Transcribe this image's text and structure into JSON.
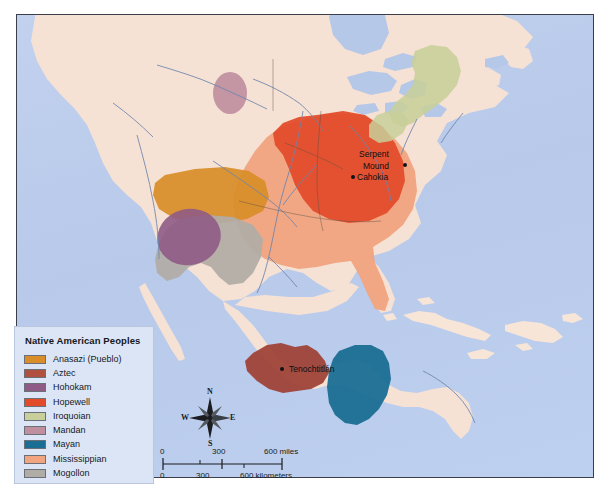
{
  "map": {
    "title_alt": "Native American Peoples map of North America",
    "ocean_color": "#bccdec",
    "land_color": "#f6e2d4",
    "border_color": "#3a3f4a"
  },
  "legend": {
    "title": "Native American Peoples",
    "items": [
      {
        "label": "Anasazi (Pueblo)",
        "color": "#d98e2a",
        "key": "anasazi"
      },
      {
        "label": "Aztec",
        "color": "#b0503f",
        "key": "aztec"
      },
      {
        "label": "Hohokam",
        "color": "#8f5b86",
        "key": "hohokam"
      },
      {
        "label": "Hopewell",
        "color": "#e24a2a",
        "key": "hopewell"
      },
      {
        "label": "Iroquoian",
        "color": "#c8cf9a",
        "key": "iroquoian"
      },
      {
        "label": "Mandan",
        "color": "#bf8fa0",
        "key": "mandan"
      },
      {
        "label": "Mayan",
        "color": "#1a6e94",
        "key": "mayan"
      },
      {
        "label": "Mississippian",
        "color": "#f0a480",
        "key": "mississippian"
      },
      {
        "label": "Mogollon",
        "color": "#b0aca6",
        "key": "mogollon"
      }
    ]
  },
  "places": [
    {
      "name": "Serpent Mound",
      "line1": "Serpent",
      "line2": "Mound"
    },
    {
      "name": "Cahokia",
      "line1": "Cahokia",
      "line2": ""
    },
    {
      "name": "Tenochtitlán",
      "line1": "Tenochtitlán",
      "line2": ""
    }
  ],
  "compass": {
    "north": "N",
    "south": "S",
    "east": "E",
    "west": "W"
  },
  "scale": {
    "miles": {
      "t0": "0",
      "t1": "300",
      "t2": "600 miles"
    },
    "kilometers": {
      "t0": "0",
      "t1": "300",
      "t2": "600 kilometers"
    }
  }
}
